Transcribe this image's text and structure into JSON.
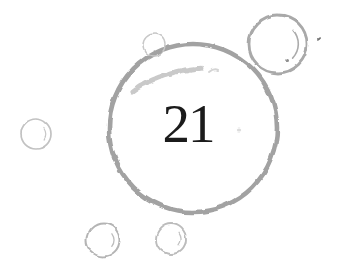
{
  "illustration": {
    "description": "hand-drawn-bubbles-sketch",
    "background": "#ffffff",
    "ink_color": "#1b1b1b",
    "canvas": {
      "width": 346,
      "height": 271
    },
    "number_label": "21",
    "number": {
      "x": 188,
      "y": 142,
      "font_size": 55
    },
    "bubbles": [
      {
        "name": "bubble-main",
        "cx": 193,
        "cy": 128,
        "r": 84,
        "stroke": "#a2a2a2",
        "width": 4.6,
        "highlights": [
          {
            "kind": "stroke",
            "d": "M 132 92 Q 162 70 204 68",
            "width": 5,
            "color": "#c9c9c9",
            "dash": "4 3"
          },
          {
            "kind": "stroke",
            "d": "M 209 72 Q 214 68 218 70",
            "width": 2,
            "color": "#d4d4d4"
          }
        ]
      },
      {
        "name": "bubble-top-right",
        "cx": 278,
        "cy": 44,
        "r": 29,
        "stroke": "#a9a9a9",
        "width": 2.8,
        "highlights": [
          {
            "kind": "arc",
            "r_ratio": 0.7,
            "start": -42,
            "end": 44,
            "width": 1.6,
            "color": "#ababab"
          },
          {
            "kind": "dot",
            "dx": 9.5,
            "dy": 16.5,
            "size": 1.5,
            "color": "#8d8d8d"
          }
        ]
      },
      {
        "name": "bubble-top-small",
        "cx": 154,
        "cy": 45,
        "r": 11,
        "stroke": "#c8c8c8",
        "width": 1.4,
        "highlights": []
      },
      {
        "name": "bubble-left",
        "cx": 36,
        "cy": 134,
        "r": 15,
        "stroke": "#c2c2c2",
        "width": 1.7,
        "highlights": [
          {
            "kind": "arc",
            "r_ratio": 0.64,
            "start": -35,
            "end": 32,
            "width": 1.2,
            "color": "#c6c6c6"
          }
        ]
      },
      {
        "name": "bubble-bottom-left",
        "cx": 103,
        "cy": 240,
        "r": 16.5,
        "stroke": "#b4b4b4",
        "width": 2,
        "highlights": [
          {
            "kind": "arc",
            "r_ratio": 0.66,
            "start": -35,
            "end": 36,
            "width": 1.3,
            "color": "#bdbdbd"
          }
        ]
      },
      {
        "name": "bubble-bottom-mid",
        "cx": 171,
        "cy": 239,
        "r": 15,
        "stroke": "#bcbcbc",
        "width": 1.9,
        "highlights": [
          {
            "kind": "arc",
            "r_ratio": 0.66,
            "start": -35,
            "end": 36,
            "width": 1.3,
            "color": "#c2c2c2"
          }
        ]
      }
    ],
    "marks": [
      {
        "name": "ink-speck",
        "x": 320,
        "y": 39,
        "rx": 2.4,
        "ry": 1.0,
        "rotate": -38,
        "color": "#717171"
      },
      {
        "name": "faint-smudge",
        "x": 238,
        "y": 130,
        "rx": 2.2,
        "ry": 1.6,
        "rotate": 0,
        "color": "#dcdcdc"
      }
    ]
  }
}
